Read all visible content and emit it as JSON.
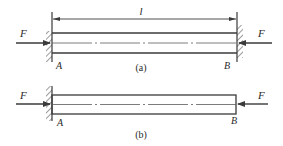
{
  "figure_a": {
    "caption": "(a)",
    "length_label": "l",
    "left_force_label": "F",
    "right_force_label": "F",
    "left_support_label": "A",
    "right_support_label": "B",
    "left_support_type": "fixed-wall",
    "right_support_type": "fixed-wall"
  },
  "figure_b": {
    "caption": "(b)",
    "left_force_label": "F",
    "right_force_label": "F",
    "left_support_label": "A",
    "right_support_label": "B",
    "left_support_type": "fixed-wall",
    "right_support_type": "free-end"
  },
  "colors": {
    "line": "#3a3a3a",
    "background": "#ffffff"
  }
}
